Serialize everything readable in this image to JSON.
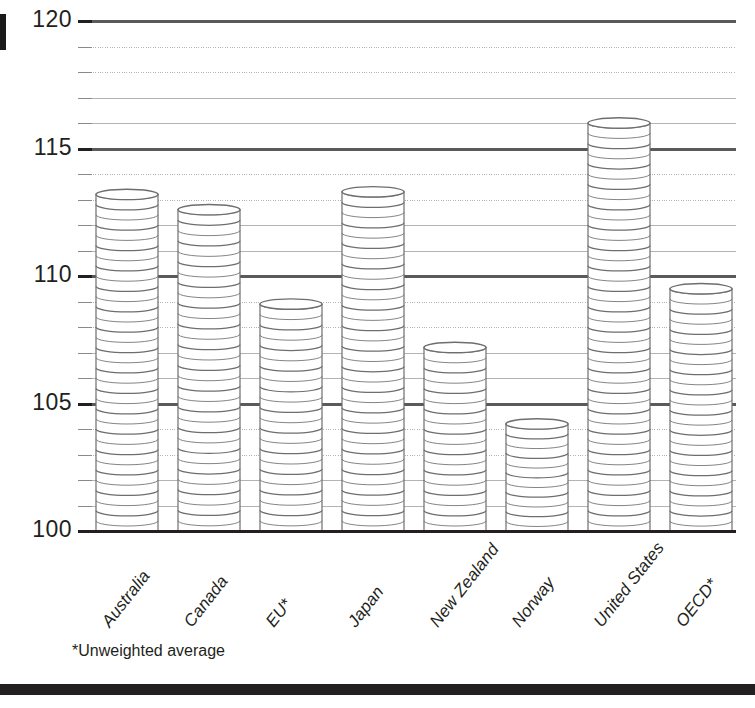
{
  "chart_data": {
    "type": "bar",
    "title": "",
    "subtitle": "",
    "xlabel": "",
    "ylabel": "",
    "categories": [
      "Australia",
      "Canada",
      "EU*",
      "Japan",
      "New Zealand",
      "Norway",
      "United States",
      "OECD*"
    ],
    "values": [
      113.2,
      112.6,
      108.9,
      113.3,
      107.2,
      104.2,
      116.0,
      109.5
    ],
    "series": [
      {
        "name": "Index",
        "values": [
          113.2,
          112.6,
          108.9,
          113.3,
          107.2,
          104.2,
          116.0,
          109.5
        ]
      }
    ],
    "ylim": [
      100,
      120
    ],
    "yticks": [
      100,
      105,
      110,
      115,
      120
    ],
    "ytick_labels": [
      "100",
      "105",
      "110",
      "115",
      "120"
    ],
    "minor_tick_step": 1,
    "grid": true,
    "grid_major_color": "#5a5a5a",
    "grid_minor_color": "#b3b3b3",
    "legend": "none",
    "annotations": [
      "*Unweighted average"
    ],
    "bar_style": "stacked-coins",
    "bar_fill": "#ffffff",
    "bar_outline": "#6e6e6e"
  },
  "annotation": {
    "footnote": "*Unweighted average"
  },
  "axis": {
    "y_tick_labels": [
      "120",
      "115",
      "110",
      "105",
      "100"
    ]
  },
  "colors": {
    "ink": "#231f20",
    "rule": "#231f20",
    "grid_major": "#5a5a5a",
    "grid_minor": "#b3b3b3",
    "coin_outline": "#6e6e6e"
  }
}
